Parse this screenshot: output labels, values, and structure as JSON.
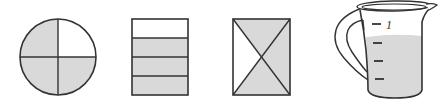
{
  "figure": {
    "colors": {
      "stroke": "#333333",
      "shade": "#d9d9d9",
      "background": "#ffffff"
    },
    "models": [
      {
        "name": "circle",
        "parts": 4,
        "shaded_parts": 3,
        "unshaded": "top-right quarter"
      },
      {
        "name": "rectangle-strips",
        "parts": 4,
        "shaded_parts": 3,
        "unshaded": "top strip"
      },
      {
        "name": "rectangle-diagonals",
        "parts": 4,
        "shaded_parts": 3,
        "unshaded": "left triangle"
      },
      {
        "name": "measuring-pitcher",
        "scale_label": "1",
        "graduations": 4,
        "fill_level": "3/4"
      }
    ]
  }
}
